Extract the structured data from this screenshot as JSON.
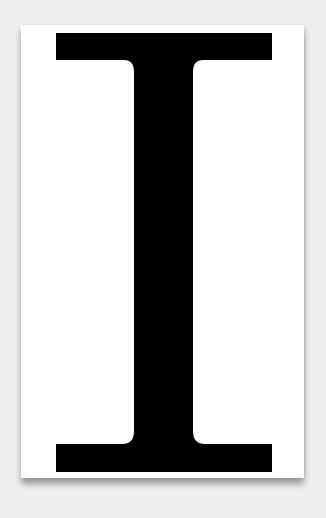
{
  "card": {
    "letter": "I",
    "background_color": "#ffffff",
    "glyph_color": "#000000"
  },
  "page": {
    "background_color": "#eeeeee"
  }
}
